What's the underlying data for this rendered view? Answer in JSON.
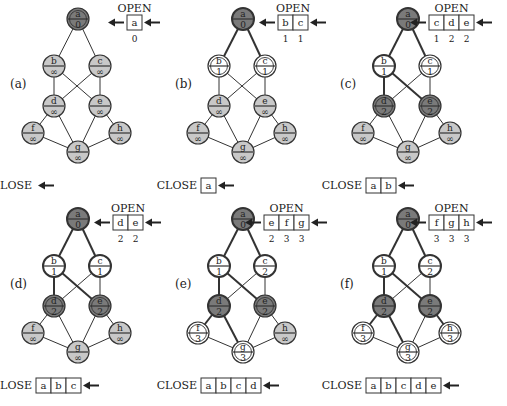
{
  "figure": {
    "node_positions": {
      "a": [
        78,
        19
      ],
      "b": [
        54,
        66
      ],
      "c": [
        100,
        66
      ],
      "d": [
        54,
        106
      ],
      "e": [
        100,
        106
      ],
      "f": [
        33,
        133
      ],
      "g": [
        78,
        152
      ],
      "h": [
        120,
        133
      ]
    },
    "edges": [
      [
        "a",
        "b"
      ],
      [
        "a",
        "c"
      ],
      [
        "b",
        "d"
      ],
      [
        "b",
        "e"
      ],
      [
        "c",
        "d"
      ],
      [
        "c",
        "e"
      ],
      [
        "d",
        "f"
      ],
      [
        "d",
        "g"
      ],
      [
        "e",
        "g"
      ],
      [
        "e",
        "h"
      ],
      [
        "f",
        "g"
      ],
      [
        "h",
        "g"
      ]
    ],
    "colors": {
      "unvisited_fill": "#c8c8c8",
      "closed_fill": "#7a7a7a",
      "open_fill": "#ffffff",
      "stroke": "#333333"
    },
    "panels": [
      {
        "label": "(a)",
        "dx": 0,
        "dy": 0,
        "open_label": "OPEN",
        "close_label": "CLOSE",
        "open": [
          "a"
        ],
        "open_costs": [
          "0"
        ],
        "close": [],
        "nodes": {
          "a": {
            "value": "0",
            "state": "current"
          },
          "b": {
            "value": "∞",
            "state": "unvisited"
          },
          "c": {
            "value": "∞",
            "state": "unvisited"
          },
          "d": {
            "value": "∞",
            "state": "unvisited"
          },
          "e": {
            "value": "∞",
            "state": "unvisited"
          },
          "f": {
            "value": "∞",
            "state": "unvisited"
          },
          "g": {
            "value": "∞",
            "state": "unvisited"
          },
          "h": {
            "value": "∞",
            "state": "unvisited"
          }
        },
        "bold_edges": []
      },
      {
        "label": "(b)",
        "dx": 165,
        "dy": 0,
        "open_label": "OPEN",
        "close_label": "CLOSE",
        "open": [
          "b",
          "c"
        ],
        "open_costs": [
          "1",
          "1"
        ],
        "close": [
          "a"
        ],
        "nodes": {
          "a": {
            "value": "0",
            "state": "closed"
          },
          "b": {
            "value": "1",
            "state": "open"
          },
          "c": {
            "value": "1",
            "state": "open"
          },
          "d": {
            "value": "∞",
            "state": "unvisited"
          },
          "e": {
            "value": "∞",
            "state": "unvisited"
          },
          "f": {
            "value": "∞",
            "state": "unvisited"
          },
          "g": {
            "value": "∞",
            "state": "unvisited"
          },
          "h": {
            "value": "∞",
            "state": "unvisited"
          }
        },
        "bold_edges": [
          [
            "a",
            "b"
          ],
          [
            "a",
            "c"
          ]
        ]
      },
      {
        "label": "(c)",
        "dx": 330,
        "dy": 0,
        "open_label": "OPEN",
        "close_label": "CLOSE",
        "open": [
          "c",
          "d",
          "e"
        ],
        "open_costs": [
          "1",
          "2",
          "2"
        ],
        "close": [
          "a",
          "b"
        ],
        "nodes": {
          "a": {
            "value": "0",
            "state": "closed"
          },
          "b": {
            "value": "1",
            "state": "expanded"
          },
          "c": {
            "value": "1",
            "state": "open"
          },
          "d": {
            "value": "2",
            "state": "open-dark"
          },
          "e": {
            "value": "2",
            "state": "open-dark"
          },
          "f": {
            "value": "∞",
            "state": "unvisited"
          },
          "g": {
            "value": "∞",
            "state": "unvisited"
          },
          "h": {
            "value": "∞",
            "state": "unvisited"
          }
        },
        "bold_edges": [
          [
            "a",
            "b"
          ],
          [
            "a",
            "c"
          ],
          [
            "b",
            "d"
          ],
          [
            "b",
            "e"
          ]
        ]
      },
      {
        "label": "(d)",
        "dx": 0,
        "dy": 200,
        "open_label": "OPEN",
        "close_label": "CLOSE",
        "open": [
          "d",
          "e"
        ],
        "open_costs": [
          "2",
          "2"
        ],
        "close": [
          "a",
          "b",
          "c"
        ],
        "nodes": {
          "a": {
            "value": "0",
            "state": "closed"
          },
          "b": {
            "value": "1",
            "state": "expanded"
          },
          "c": {
            "value": "1",
            "state": "expanded"
          },
          "d": {
            "value": "2",
            "state": "open-dark"
          },
          "e": {
            "value": "2",
            "state": "open-dark"
          },
          "f": {
            "value": "∞",
            "state": "unvisited"
          },
          "g": {
            "value": "∞",
            "state": "unvisited"
          },
          "h": {
            "value": "∞",
            "state": "unvisited"
          }
        },
        "bold_edges": [
          [
            "a",
            "b"
          ],
          [
            "a",
            "c"
          ],
          [
            "b",
            "d"
          ],
          [
            "b",
            "e"
          ]
        ]
      },
      {
        "label": "(e)",
        "dx": 165,
        "dy": 200,
        "open_label": "OPEN",
        "close_label": "CLOSE",
        "open": [
          "e",
          "f",
          "g"
        ],
        "open_costs": [
          "2",
          "3",
          "3"
        ],
        "close": [
          "a",
          "b",
          "c",
          "d"
        ],
        "nodes": {
          "a": {
            "value": "0",
            "state": "closed"
          },
          "b": {
            "value": "1",
            "state": "expanded"
          },
          "c": {
            "value": "2",
            "state": "expanded"
          },
          "d": {
            "value": "2",
            "state": "closed"
          },
          "e": {
            "value": "2",
            "state": "open-dark"
          },
          "f": {
            "value": "3",
            "state": "open"
          },
          "g": {
            "value": "3",
            "state": "open"
          },
          "h": {
            "value": "∞",
            "state": "unvisited"
          }
        },
        "bold_edges": [
          [
            "a",
            "b"
          ],
          [
            "a",
            "c"
          ],
          [
            "b",
            "d"
          ],
          [
            "b",
            "e"
          ],
          [
            "d",
            "f"
          ],
          [
            "d",
            "g"
          ]
        ]
      },
      {
        "label": "(f)",
        "dx": 330,
        "dy": 200,
        "open_label": "OPEN",
        "close_label": "CLOSE",
        "open": [
          "f",
          "g",
          "h"
        ],
        "open_costs": [
          "3",
          "3",
          "3"
        ],
        "close": [
          "a",
          "b",
          "c",
          "d",
          "e"
        ],
        "nodes": {
          "a": {
            "value": "0",
            "state": "closed"
          },
          "b": {
            "value": "1",
            "state": "expanded"
          },
          "c": {
            "value": "2",
            "state": "expanded"
          },
          "d": {
            "value": "2",
            "state": "closed"
          },
          "e": {
            "value": "2",
            "state": "closed"
          },
          "f": {
            "value": "3",
            "state": "open"
          },
          "g": {
            "value": "3",
            "state": "open"
          },
          "h": {
            "value": "3",
            "state": "open"
          }
        },
        "bold_edges": [
          [
            "a",
            "b"
          ],
          [
            "a",
            "c"
          ],
          [
            "b",
            "d"
          ],
          [
            "b",
            "e"
          ],
          [
            "d",
            "f"
          ],
          [
            "d",
            "g"
          ],
          [
            "e",
            "h"
          ]
        ]
      }
    ]
  }
}
